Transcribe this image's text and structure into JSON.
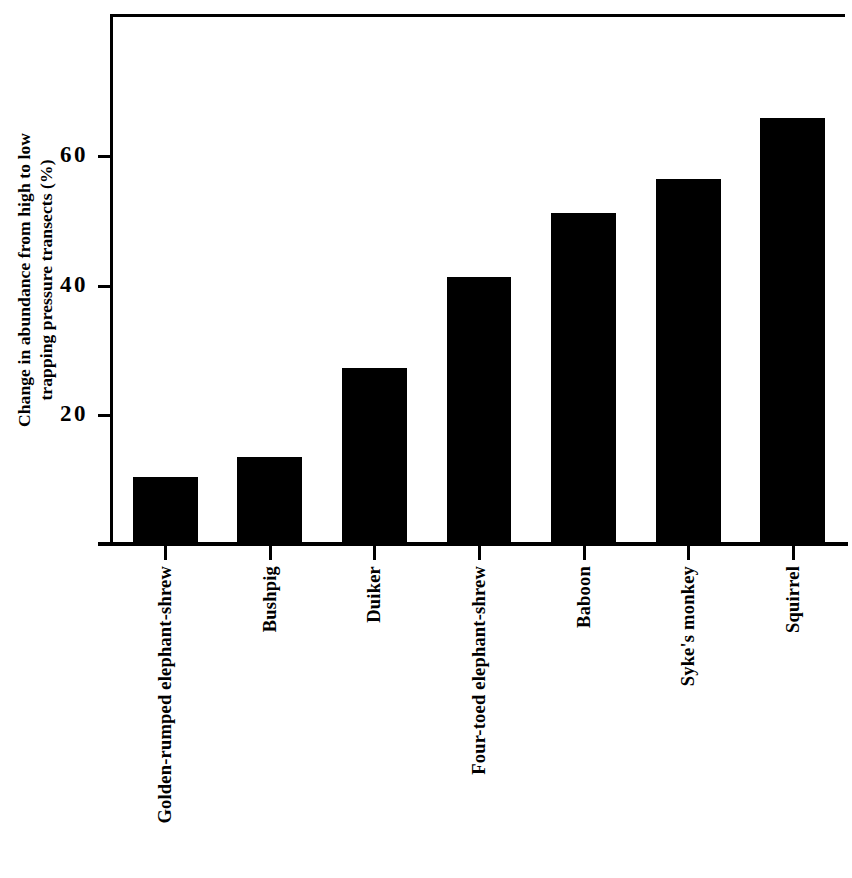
{
  "chart_data": {
    "type": "bar",
    "title": "",
    "subtitle": "",
    "xlabel": "",
    "ylabel_line1": "Change in abundance from high to low",
    "ylabel_line2": "trapping pressure transects (%)",
    "ylabel": "Change in abundance from high to low trapping pressure transects (%)",
    "categories": [
      "Golden-rumped elephant-shrew",
      "Bushpig",
      "Duiker",
      "Four-toed elephant-shrew",
      "Baboon",
      "Syke's monkey",
      "Squirrel"
    ],
    "values": [
      10.3,
      13.4,
      27.3,
      41.4,
      51.3,
      56.5,
      66.0
    ],
    "ylim": [
      0,
      78
    ],
    "yticks": [
      20,
      40,
      60
    ],
    "ytick_labels": [
      "20",
      "40",
      "60"
    ],
    "grid": false,
    "legend": false,
    "legend_position": "none",
    "bar_color": "#000000",
    "background_color": "#ffffff",
    "axis_color": "#000000"
  }
}
